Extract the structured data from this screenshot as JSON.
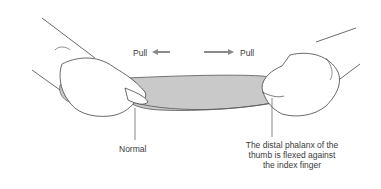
{
  "figure": {
    "labels": {
      "pull_left": "Pull",
      "pull_right": "Pull",
      "normal": "Normal",
      "abnormal_line1": "The distal phalanx of the",
      "abnormal_line2": "thumb is flexed against",
      "abnormal_line3": "the index finger"
    },
    "arrows": [
      {
        "direction": "left",
        "color": "#8a8a8a"
      },
      {
        "direction": "right",
        "color": "#8a8a8a"
      }
    ],
    "colors": {
      "paper_fill": "#c9c9c9",
      "outline": "#4a4a4a",
      "text": "#3a3a3a",
      "background": "#ffffff"
    }
  }
}
